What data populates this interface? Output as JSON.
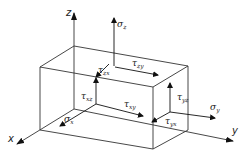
{
  "diagram": {
    "colors": {
      "line": "#333333",
      "arrow": "#111111",
      "background": "#ffffff"
    },
    "axes": [
      {
        "name": "z",
        "label": "z"
      },
      {
        "name": "x",
        "label": "x"
      },
      {
        "name": "y",
        "label": "y"
      }
    ],
    "stresses": {
      "sigma_z": {
        "symbol": "σ",
        "subscript": "z"
      },
      "sigma_y": {
        "symbol": "σ",
        "subscript": "y"
      },
      "sigma_x": {
        "symbol": "σ",
        "subscript": "x"
      },
      "tau_zx": {
        "symbol": "τ",
        "subscript": "zx"
      },
      "tau_zy": {
        "symbol": "τ",
        "subscript": "zy"
      },
      "tau_xz": {
        "symbol": "τ",
        "subscript": "xz"
      },
      "tau_xy": {
        "symbol": "τ",
        "subscript": "xy"
      },
      "tau_yz": {
        "symbol": "τ",
        "subscript": "yz"
      },
      "tau_yx": {
        "symbol": "τ",
        "subscript": "yx"
      }
    }
  }
}
